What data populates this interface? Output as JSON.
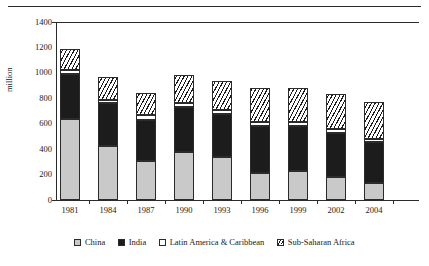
{
  "chart_data": {
    "type": "bar",
    "subtype": "stacked-vertical",
    "title": "",
    "xlabel": "",
    "ylabel": "million",
    "ylim": [
      0,
      1400
    ],
    "yticks": [
      0,
      200,
      400,
      600,
      800,
      1000,
      1200,
      1400
    ],
    "grid": false,
    "legend_position": "bottom",
    "categories": [
      "1981",
      "1984",
      "1987",
      "1990",
      "1993",
      "1996",
      "1999",
      "2002",
      "2004"
    ],
    "series": [
      {
        "name": "China",
        "color": "#c9c9c9",
        "pattern": "solid-gray",
        "values": [
          635,
          425,
          310,
          375,
          335,
          210,
          225,
          180,
          130
        ]
      },
      {
        "name": "India",
        "color": "#1c1c1c",
        "pattern": "solid-black",
        "values": [
          360,
          340,
          320,
          355,
          340,
          375,
          355,
          345,
          325
        ]
      },
      {
        "name": "Latin America & Caribbean",
        "color": "#ffffff",
        "pattern": "open-white",
        "values": [
          25,
          25,
          35,
          35,
          35,
          30,
          30,
          30,
          25
        ]
      },
      {
        "name": "Sub-Saharan Africa",
        "color": "#ffffff",
        "pattern": "diagonal-hatch",
        "values": [
          165,
          175,
          180,
          215,
          225,
          265,
          275,
          280,
          290
        ]
      }
    ],
    "totals": [
      1185,
      965,
      845,
      980,
      935,
      880,
      885,
      835,
      770
    ]
  },
  "axes": {
    "y_title": "million",
    "y_tick_labels": [
      "1400",
      "1200",
      "1000",
      "800",
      "600",
      "400",
      "200",
      "0"
    ],
    "x_tick_labels": [
      "1981",
      "1984",
      "1987",
      "1990",
      "1993",
      "1996",
      "1999",
      "2002",
      "2004"
    ]
  },
  "legend": {
    "items": [
      {
        "label": "China"
      },
      {
        "label": "India"
      },
      {
        "label": "Latin America & Caribbean"
      },
      {
        "label": "Sub-Saharan Africa"
      }
    ]
  }
}
